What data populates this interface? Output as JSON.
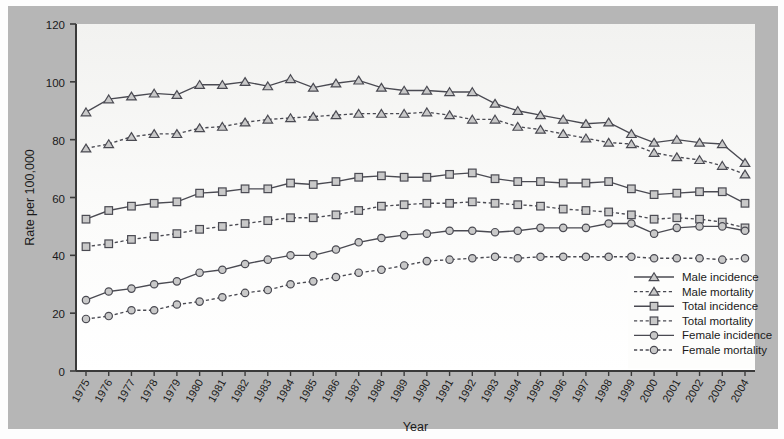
{
  "chart_data": {
    "type": "line",
    "title": "",
    "xlabel": "Year",
    "ylabel": "Rate per 100,000",
    "grid": false,
    "legend_position": "bottom-right",
    "x": [
      1975,
      1976,
      1977,
      1978,
      1979,
      1980,
      1981,
      1982,
      1983,
      1984,
      1985,
      1986,
      1987,
      1988,
      1989,
      1990,
      1991,
      1992,
      1993,
      1994,
      1995,
      1996,
      1997,
      1998,
      1999,
      2000,
      2001,
      2002,
      2003,
      2004
    ],
    "xtick_labels": [
      "1975",
      "1976",
      "1977",
      "1978",
      "1979",
      "1980",
      "1981",
      "1982",
      "1983",
      "1984",
      "1985",
      "1986",
      "1987",
      "1988",
      "1989",
      "1990",
      "1991",
      "1992",
      "1993",
      "1994",
      "1995",
      "1996",
      "1997",
      "1998",
      "1999",
      "2000",
      "2001",
      "2002",
      "2003",
      "2004"
    ],
    "ytick_labels": [
      "0",
      "20",
      "40",
      "60",
      "80",
      "100",
      "120"
    ],
    "yticks": [
      0,
      20,
      40,
      60,
      80,
      100,
      120
    ],
    "ylim": [
      0,
      120
    ],
    "series": [
      {
        "name": "Male incidence",
        "marker": "triangle",
        "line_style": "solid",
        "values": [
          89.5,
          94.0,
          95.0,
          96.0,
          95.5,
          99.0,
          99.0,
          100.0,
          98.5,
          101.0,
          98.0,
          99.5,
          100.5,
          98.0,
          97.0,
          97.0,
          96.5,
          96.5,
          92.5,
          90.0,
          88.5,
          87.0,
          85.5,
          86.0,
          82.0,
          79.0,
          80.0,
          79.0,
          78.5,
          72.0
        ]
      },
      {
        "name": "Male mortality",
        "marker": "triangle",
        "line_style": "dashed",
        "values": [
          77.0,
          78.5,
          81.0,
          82.0,
          82.0,
          84.0,
          84.5,
          86.0,
          87.0,
          87.5,
          88.0,
          88.5,
          89.0,
          89.0,
          89.0,
          89.5,
          88.5,
          87.0,
          87.0,
          84.5,
          83.5,
          82.0,
          80.5,
          79.0,
          78.5,
          75.5,
          74.0,
          73.0,
          71.0,
          68.0
        ]
      },
      {
        "name": "Total incidence",
        "marker": "square",
        "line_style": "solid",
        "values": [
          52.5,
          55.5,
          57.0,
          58.0,
          58.5,
          61.5,
          62.0,
          63.0,
          63.0,
          65.0,
          64.5,
          65.5,
          67.0,
          67.5,
          67.0,
          67.0,
          68.0,
          68.5,
          66.5,
          65.5,
          65.5,
          65.0,
          65.0,
          65.5,
          63.0,
          61.0,
          61.5,
          62.0,
          62.0,
          58.0
        ]
      },
      {
        "name": "Total mortality",
        "marker": "square",
        "line_style": "dashed",
        "values": [
          43.0,
          44.0,
          45.5,
          46.5,
          47.5,
          49.0,
          50.0,
          51.0,
          52.0,
          53.0,
          53.0,
          54.0,
          55.5,
          57.0,
          57.5,
          58.0,
          58.0,
          58.5,
          58.0,
          57.5,
          57.0,
          56.0,
          55.5,
          55.0,
          54.0,
          52.5,
          53.0,
          52.5,
          51.5,
          49.5
        ]
      },
      {
        "name": "Female incidence",
        "marker": "circle",
        "line_style": "solid",
        "values": [
          24.5,
          27.5,
          28.5,
          30.0,
          31.0,
          34.0,
          35.0,
          37.0,
          38.5,
          40.0,
          40.0,
          42.0,
          44.5,
          46.0,
          47.0,
          47.5,
          48.5,
          48.5,
          48.0,
          48.5,
          49.5,
          49.5,
          49.5,
          51.0,
          51.0,
          47.5,
          49.5,
          50.0,
          50.0,
          48.5
        ]
      },
      {
        "name": "Female mortality",
        "marker": "circle",
        "line_style": "dashed",
        "values": [
          18.0,
          19.0,
          21.0,
          21.0,
          23.0,
          24.0,
          25.5,
          27.0,
          28.0,
          30.0,
          31.0,
          32.5,
          34.0,
          35.0,
          36.5,
          38.0,
          38.5,
          39.0,
          39.5,
          39.0,
          39.5,
          39.5,
          39.5,
          39.5,
          39.5,
          39.0,
          39.0,
          39.0,
          38.5,
          39.0
        ]
      }
    ]
  },
  "axis": {
    "ylabel": "Rate per 100,000",
    "xlabel": "Year"
  },
  "legend": {
    "items": [
      {
        "label": "Male incidence"
      },
      {
        "label": "Male mortality"
      },
      {
        "label": "Total incidence"
      },
      {
        "label": "Total mortality"
      },
      {
        "label": "Female incidence"
      },
      {
        "label": "Female mortality"
      }
    ]
  },
  "colors": {
    "background": "#b6b6b6",
    "plot_background": "#f7f7f5",
    "line": "#4a4a52",
    "marker_fill": "#c9c9c9",
    "axis": "#3a3a3a",
    "text": "#1a1a1a"
  }
}
